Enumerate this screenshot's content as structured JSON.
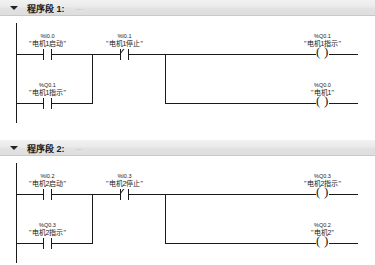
{
  "app": {
    "editor": "ladder-logic",
    "colors": {
      "header_bg": "#e8e8e8",
      "line": "#1a1a1a",
      "page_bg": "#ffffff",
      "ellipsis": "#b4b4b4"
    }
  },
  "networks": [
    {
      "title": "程序段 1:",
      "ellipsis": "...",
      "elements": {
        "start_contact": {
          "address": "%I0.0",
          "symbol": "\"电机1启动\"",
          "kind": "contact-no"
        },
        "stop_contact": {
          "address": "%I0.1",
          "symbol": "\"电机1停止\"",
          "kind": "contact-nc"
        },
        "latch_contact": {
          "address": "%Q0.1",
          "symbol": "\"电机1指示\"",
          "kind": "contact-no"
        },
        "coil_top": {
          "address": "%Q0.1",
          "symbol": "\"电机1指示\"",
          "kind": "coil"
        },
        "coil_bottom": {
          "address": "%Q0.0",
          "symbol": "\"电机1\"",
          "kind": "coil"
        }
      }
    },
    {
      "title": "程序段 2:",
      "ellipsis": "...",
      "elements": {
        "start_contact": {
          "address": "%I0.2",
          "symbol": "\"电机2启动\"",
          "kind": "contact-no"
        },
        "stop_contact": {
          "address": "%I0.3",
          "symbol": "\"电机2停止\"",
          "kind": "contact-nc"
        },
        "latch_contact": {
          "address": "%Q0.3",
          "symbol": "\"电机2指示\"",
          "kind": "contact-no"
        },
        "coil_top": {
          "address": "%Q0.3",
          "symbol": "\"电机2指示\"",
          "kind": "coil"
        },
        "coil_bottom": {
          "address": "%Q0.2",
          "symbol": "\"电机2\"",
          "kind": "coil"
        }
      }
    }
  ]
}
